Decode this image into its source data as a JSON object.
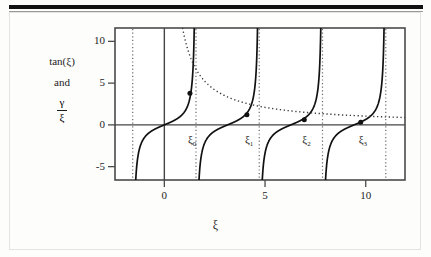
{
  "chart_data": {
    "type": "line",
    "title": "",
    "xlabel": "ξ",
    "ylabel_lines": [
      "tan(ξ)",
      "and"
    ],
    "ylabel_fraction": {
      "numerator": "γ",
      "denominator": "ξ"
    },
    "xlim": [
      -2.45,
      11.95
    ],
    "ylim": [
      -6.6,
      11.6
    ],
    "xticks": [
      0,
      5,
      10
    ],
    "xticklabels": [
      "0",
      "5",
      "10"
    ],
    "yticks": [
      -5,
      0,
      5,
      10
    ],
    "yticklabels": [
      "-5",
      "0",
      "5",
      "10"
    ],
    "grid": false,
    "legend": "none",
    "series": [
      {
        "name": "tan(ξ)",
        "style": "solid",
        "color": "#111111",
        "function": "tan",
        "period": 3.14159265,
        "branch_centers": [
          0,
          3.14159265,
          6.28318531,
          9.42477796
        ]
      },
      {
        "name": "γ/ξ",
        "style": "dotted",
        "color": "#3a3a3a",
        "function": "gamma_over_xi",
        "gamma": 10.5
      }
    ],
    "asymptotes": {
      "style": "dotted",
      "color": "#6a6a6a",
      "values": [
        -1.5708,
        1.5708,
        4.7124,
        7.854,
        10.9956
      ]
    },
    "zero_lines": {
      "x": 0,
      "y": 0,
      "color": "#444444"
    },
    "intersections": [
      {
        "label": "ξ",
        "sub": "0",
        "x": 1.2715,
        "y": 3.78
      },
      {
        "label": "ξ",
        "sub": "1",
        "x": 4.1,
        "y": 1.2
      },
      {
        "label": "ξ",
        "sub": "2",
        "x": 6.95,
        "y": 0.62
      },
      {
        "label": "ξ",
        "sub": "3",
        "x": 9.75,
        "y": 0.3
      }
    ],
    "intersection_label_offsets": {
      "dx": -2,
      "dy": 22
    }
  }
}
